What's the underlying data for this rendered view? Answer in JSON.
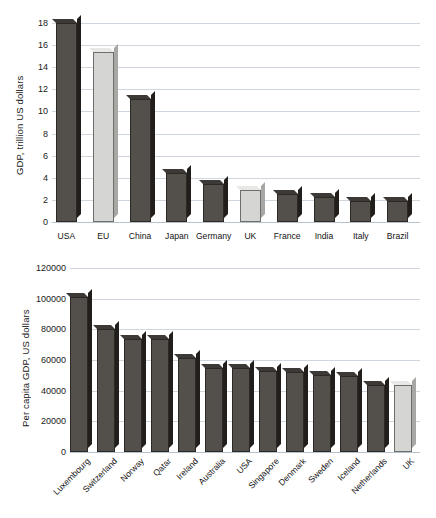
{
  "chart_data": [
    {
      "type": "bar",
      "title": "",
      "xlabel": "",
      "ylabel": "GDP, trillion US dollars",
      "ylim": [
        0,
        18
      ],
      "yticks": [
        0,
        2,
        4,
        6,
        8,
        10,
        12,
        14,
        16,
        18
      ],
      "ytick_labels": [
        "0",
        "2",
        "4",
        "6",
        "8",
        "10",
        "12",
        "14",
        "16",
        "18"
      ],
      "grid": true,
      "legend": "none",
      "categories": [
        "USA",
        "EU",
        "China",
        "Japan",
        "Germany",
        "UK",
        "France",
        "India",
        "Italy",
        "Brazil"
      ],
      "values": [
        18.0,
        15.4,
        11.1,
        4.4,
        3.4,
        2.9,
        2.5,
        2.3,
        1.9,
        1.9
      ],
      "highlight": [
        "EU",
        "UK"
      ],
      "colors": {
        "bar": "#534f4b",
        "bar_highlight": "#d5d5d3",
        "grid": "#cfd6dd"
      }
    },
    {
      "type": "bar",
      "title": "",
      "xlabel": "",
      "ylabel": "Per capita GDP, US dollars",
      "ylim": [
        0,
        120000
      ],
      "yticks": [
        0,
        20000,
        40000,
        60000,
        80000,
        100000,
        120000
      ],
      "ytick_labels": [
        "0",
        "20000",
        "40000",
        "60000",
        "80000",
        "100000",
        "120000"
      ],
      "grid": true,
      "legend": "none",
      "categories": [
        "Luxembourg",
        "Switzerland",
        "Norway",
        "Qatar",
        "Ireland",
        "Australia",
        "USA",
        "Singapore",
        "Denmark",
        "Sweden",
        "Iceland",
        "Netherlands",
        "UK"
      ],
      "values": [
        101000,
        80500,
        74000,
        73800,
        61000,
        55000,
        54900,
        52600,
        52000,
        50200,
        49500,
        44000,
        43700
      ],
      "highlight": [
        "UK"
      ],
      "colors": {
        "bar": "#534f4b",
        "bar_highlight": "#d5d5d3",
        "grid": "#cfd6dd"
      }
    }
  ]
}
